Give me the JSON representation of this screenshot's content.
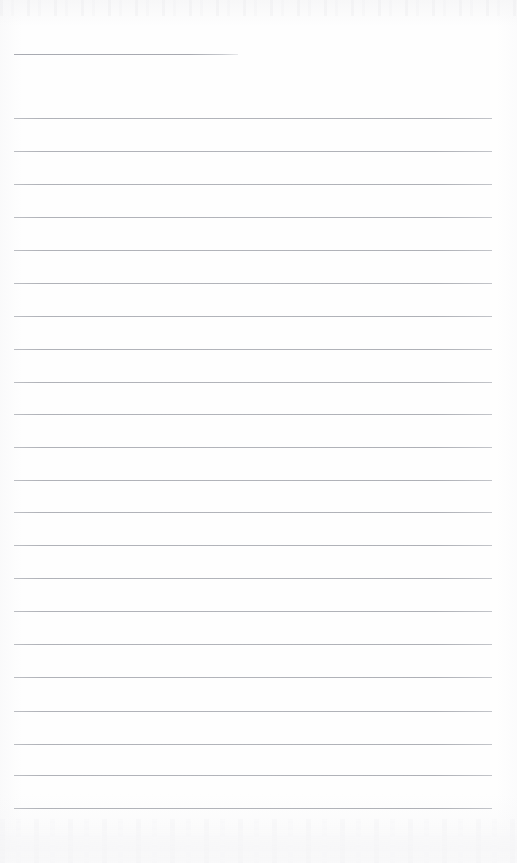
{
  "document": {
    "kind": "scanned-ruled-page",
    "title": "Blank ruled notebook page",
    "page_width": 517,
    "page_height": 863,
    "background_color": "#fefefe",
    "rule_color": "#b3b5bb",
    "has_text_content": false,
    "content_text": ""
  },
  "ruling": {
    "left_margin_x": 14,
    "right_margin_x": 492,
    "line_thickness": 1,
    "line_spacing": 32.7,
    "first_full_line_y": 118,
    "last_full_line_y": 808,
    "full_line_count": 22,
    "partial_line_count": 1
  },
  "lines": [
    {
      "index": 0,
      "y": 54,
      "x_start": 14,
      "x_end": 238,
      "type": "partial"
    },
    {
      "index": 1,
      "y": 118,
      "x_start": 14,
      "x_end": 492,
      "type": "full"
    },
    {
      "index": 2,
      "y": 151,
      "x_start": 14,
      "x_end": 492,
      "type": "full"
    },
    {
      "index": 3,
      "y": 184,
      "x_start": 14,
      "x_end": 492,
      "type": "full"
    },
    {
      "index": 4,
      "y": 217,
      "x_start": 14,
      "x_end": 492,
      "type": "full"
    },
    {
      "index": 5,
      "y": 250,
      "x_start": 14,
      "x_end": 492,
      "type": "full"
    },
    {
      "index": 6,
      "y": 283,
      "x_start": 14,
      "x_end": 492,
      "type": "full"
    },
    {
      "index": 7,
      "y": 316,
      "x_start": 14,
      "x_end": 492,
      "type": "full"
    },
    {
      "index": 8,
      "y": 349,
      "x_start": 14,
      "x_end": 492,
      "type": "full"
    },
    {
      "index": 9,
      "y": 382,
      "x_start": 14,
      "x_end": 492,
      "type": "full"
    },
    {
      "index": 10,
      "y": 414,
      "x_start": 14,
      "x_end": 492,
      "type": "full"
    },
    {
      "index": 11,
      "y": 447,
      "x_start": 14,
      "x_end": 492,
      "type": "full"
    },
    {
      "index": 12,
      "y": 480,
      "x_start": 14,
      "x_end": 492,
      "type": "full"
    },
    {
      "index": 13,
      "y": 512,
      "x_start": 14,
      "x_end": 492,
      "type": "full"
    },
    {
      "index": 14,
      "y": 545,
      "x_start": 14,
      "x_end": 492,
      "type": "full"
    },
    {
      "index": 15,
      "y": 578,
      "x_start": 14,
      "x_end": 492,
      "type": "full"
    },
    {
      "index": 16,
      "y": 611,
      "x_start": 14,
      "x_end": 492,
      "type": "full"
    },
    {
      "index": 17,
      "y": 644,
      "x_start": 14,
      "x_end": 492,
      "type": "full"
    },
    {
      "index": 18,
      "y": 677,
      "x_start": 14,
      "x_end": 492,
      "type": "full"
    },
    {
      "index": 19,
      "y": 711,
      "x_start": 14,
      "x_end": 492,
      "type": "full"
    },
    {
      "index": 20,
      "y": 744,
      "x_start": 14,
      "x_end": 492,
      "type": "full"
    },
    {
      "index": 21,
      "y": 775,
      "x_start": 14,
      "x_end": 492,
      "type": "full"
    },
    {
      "index": 22,
      "y": 808,
      "x_start": 14,
      "x_end": 492,
      "type": "full"
    }
  ]
}
